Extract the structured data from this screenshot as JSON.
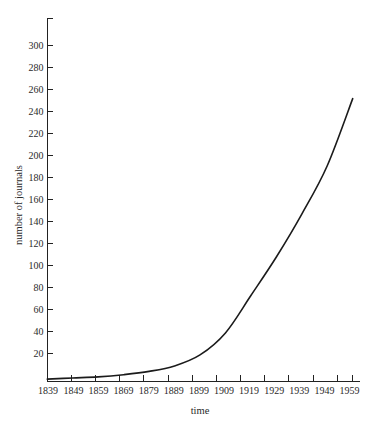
{
  "chart_data": {
    "type": "line",
    "title": "",
    "xlabel": "time",
    "ylabel": "number of journals",
    "xlim": [
      1839,
      1959
    ],
    "ylim": [
      0,
      320
    ],
    "grid": false,
    "legend": null,
    "x_tick_labels": [
      "1839",
      "1849",
      "1859",
      "1869",
      "1879",
      "1889",
      "1899",
      "1909",
      "1919",
      "1929",
      "1939",
      "1949",
      "1959"
    ],
    "y_tick_labels": [
      "20",
      "40",
      "60",
      "80",
      "100",
      "120",
      "140",
      "160",
      "180",
      "200",
      "220",
      "240",
      "260",
      "280",
      "300"
    ],
    "y_tick_values": [
      20,
      40,
      60,
      80,
      100,
      120,
      140,
      160,
      180,
      200,
      220,
      240,
      260,
      280,
      300
    ],
    "y_top_tick_unlabeled": 320,
    "x": [
      1839,
      1849,
      1859,
      1869,
      1879,
      1889,
      1899,
      1909,
      1919,
      1929,
      1939,
      1949,
      1959
    ],
    "series": [
      {
        "name": "number of journals",
        "color": "#1b1b1b",
        "values": [
          2,
          3,
          4,
          6,
          9,
          14,
          24,
          44,
          78,
          113,
          152,
          196,
          257
        ]
      }
    ]
  },
  "figure": {
    "background_color": "#ffffff",
    "axis_color": "#222222",
    "curve_color": "#1b1b1b"
  }
}
